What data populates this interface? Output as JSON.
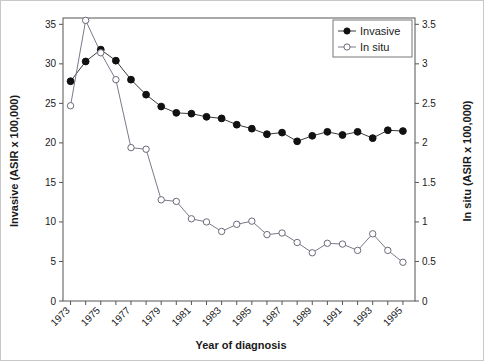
{
  "chart_data": {
    "type": "line",
    "title": "",
    "xlabel": "Year of diagnosis",
    "ylabel": "Invasive (ASIR x 100,000)",
    "y2label": "In situ (ASIR x 100,000)",
    "grid": false,
    "legend_position": "top-right",
    "x": [
      1973,
      1974,
      1975,
      1976,
      1977,
      1978,
      1979,
      1980,
      1981,
      1982,
      1983,
      1984,
      1985,
      1986,
      1987,
      1988,
      1989,
      1990,
      1991,
      1992,
      1993,
      1994,
      1995
    ],
    "xlim": [
      1972.5,
      1995.8
    ],
    "xticks": [
      1973,
      1974,
      1975,
      1976,
      1977,
      1978,
      1979,
      1980,
      1981,
      1982,
      1983,
      1984,
      1985,
      1986,
      1987,
      1988,
      1989,
      1990,
      1991,
      1992,
      1993,
      1994,
      1995
    ],
    "xtick_labels": [
      "1973",
      "",
      "1975",
      "",
      "1977",
      "",
      "1979",
      "",
      "1981",
      "",
      "1983",
      "",
      "1985",
      "",
      "1987",
      "",
      "1989",
      "",
      "1991",
      "",
      "1993",
      "",
      "1995"
    ],
    "ylim": [
      0,
      35.8
    ],
    "yticks": [
      0,
      5,
      10,
      15,
      20,
      25,
      30,
      35
    ],
    "ytick_labels": [
      "0",
      "5",
      "10",
      "15",
      "20",
      "25",
      "30",
      "35"
    ],
    "y2lim": [
      0,
      3.58
    ],
    "y2ticks": [
      0,
      0.5,
      1,
      1.5,
      2,
      2.5,
      3,
      3.5
    ],
    "y2tick_labels": [
      "0",
      "0.5",
      "1",
      "1.5",
      "2",
      "2.5",
      "3",
      "3.5"
    ],
    "series": [
      {
        "name": "Invasive",
        "axis": "left",
        "marker": "filled-circle",
        "color": "#111111",
        "values": [
          27.8,
          30.3,
          31.8,
          30.4,
          28.0,
          26.1,
          24.6,
          23.8,
          23.7,
          23.3,
          23.1,
          22.3,
          21.8,
          21.1,
          21.3,
          20.2,
          20.9,
          21.4,
          21.0,
          21.4,
          20.6,
          21.6,
          21.5
        ]
      },
      {
        "name": "In situ",
        "axis": "right",
        "marker": "open-circle",
        "color": "#6a6a7a",
        "values": [
          2.47,
          3.55,
          3.14,
          2.8,
          1.94,
          1.92,
          1.28,
          1.26,
          1.04,
          1.0,
          0.88,
          0.97,
          1.01,
          0.84,
          0.86,
          0.74,
          0.61,
          0.73,
          0.72,
          0.64,
          0.85,
          0.64,
          0.49
        ]
      }
    ]
  },
  "legend": {
    "items": [
      {
        "label": "Invasive"
      },
      {
        "label": "In situ"
      }
    ]
  },
  "axes": {
    "x_title": "Year of diagnosis",
    "y_left_title": "Invasive (ASIR x 100,000)",
    "y_right_title": "In situ (ASIR x 100,000)"
  }
}
